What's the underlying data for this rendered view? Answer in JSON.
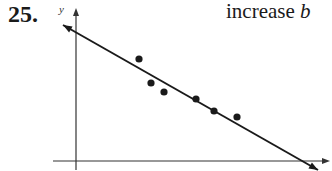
{
  "problem": {
    "number": "25.",
    "caption_text": "increase ",
    "caption_var": "b"
  },
  "axes": {
    "y_label": "y",
    "x_label": ""
  },
  "chart_data": {
    "type": "scatter",
    "title": "",
    "xlabel": "",
    "ylabel": "y",
    "grid": false,
    "legend": null,
    "note": "Scatter plot with a fitted regression line of negative slope; no tick marks or numeric labels shown. Points given in pixel coordinates.",
    "points_px": [
      {
        "x": 139,
        "y": 59
      },
      {
        "x": 151,
        "y": 83
      },
      {
        "x": 164,
        "y": 92
      },
      {
        "x": 196,
        "y": 99
      },
      {
        "x": 214,
        "y": 111
      },
      {
        "x": 237,
        "y": 117
      }
    ],
    "fit_line_px": {
      "x1": 63,
      "y1": 25,
      "x2": 318,
      "y2": 170
    },
    "y_axis_px": {
      "x": 76,
      "y_top": 8,
      "y_bottom": 170
    },
    "x_axis_px": {
      "y": 161,
      "x_left": 53,
      "x_right": 330
    }
  },
  "colors": {
    "ink": "#1a1a1a",
    "background": "#ffffff"
  }
}
